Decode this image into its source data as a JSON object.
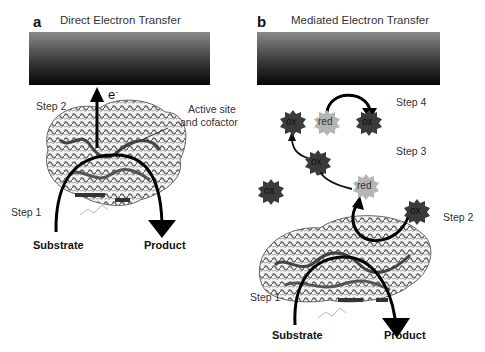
{
  "panel_a": {
    "letter": "a",
    "title": "Direct Electron Transfer",
    "electron_label": "e",
    "electron_superscript": "-",
    "step2": "Step 2",
    "step1": "Step 1",
    "active_site_label_line1": "Active site",
    "active_site_label_line2": "and cofactor",
    "substrate": "Substrate",
    "product": "Product"
  },
  "panel_b": {
    "letter": "b",
    "title": "Mediated Electron Transfer",
    "step4": "Step 4",
    "step3": "Step 3",
    "step2": "Step 2",
    "step1": "Step 1",
    "substrate": "Substrate",
    "product": "Product",
    "mediators": [
      {
        "label": "ox",
        "state": "oxidized"
      },
      {
        "label": "red",
        "state": "reduced"
      },
      {
        "label": "ox",
        "state": "oxidized"
      },
      {
        "label": "ox",
        "state": "oxidized"
      },
      {
        "label": "ox",
        "state": "oxidized"
      },
      {
        "label": "red",
        "state": "reduced"
      },
      {
        "label": "ox",
        "state": "oxidized"
      }
    ]
  },
  "colors": {
    "oxidized_fill": "#3b3b3b",
    "reduced_fill": "#b5b5b5",
    "arrow": "#000000",
    "protein": "#555555"
  }
}
